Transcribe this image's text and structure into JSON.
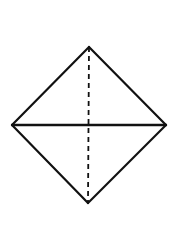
{
  "diagram": {
    "type": "diamond-with-diagonals",
    "width": 195,
    "height": 237,
    "background": "#ffffff",
    "stroke_color": "#111111",
    "vertices": {
      "top": {
        "x": 89,
        "y": 47
      },
      "right": {
        "x": 166,
        "y": 125
      },
      "bottom": {
        "x": 88,
        "y": 203
      },
      "left": {
        "x": 12,
        "y": 125
      }
    },
    "edges": [
      {
        "name": "top-left-edge",
        "from": "left",
        "to": "top",
        "style": "solid"
      },
      {
        "name": "top-right-edge",
        "from": "top",
        "to": "right",
        "style": "solid"
      },
      {
        "name": "bottom-right-edge",
        "from": "right",
        "to": "bottom",
        "style": "solid"
      },
      {
        "name": "bottom-left-edge",
        "from": "bottom",
        "to": "left",
        "style": "solid"
      }
    ],
    "diagonals": [
      {
        "name": "horizontal-diagonal",
        "from": "left",
        "to": "right",
        "style": "solid"
      },
      {
        "name": "vertical-diagonal",
        "from": "top",
        "to": "bottom",
        "style": "dashed",
        "dash": "5,4"
      }
    ]
  }
}
